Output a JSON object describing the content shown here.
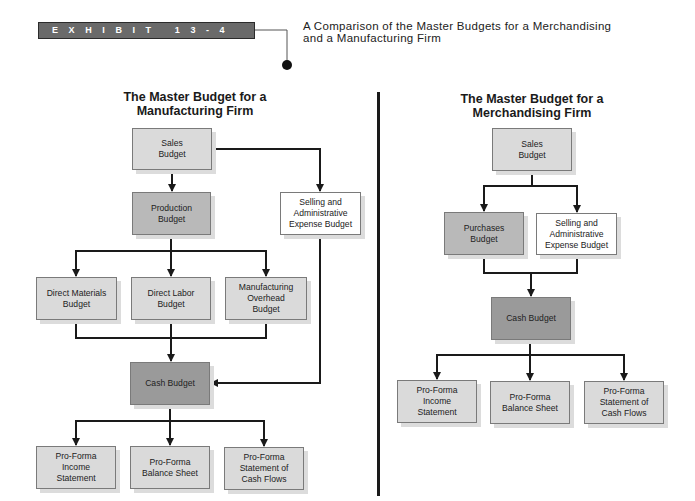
{
  "exhibit": {
    "label": "EXHIBIT 13-4",
    "title_line1": "A Comparison of the Master Budgets for a Merchandising",
    "title_line2": "and a Manufacturing Firm"
  },
  "manufacturing": {
    "title_line1": "The Master Budget for a",
    "title_line2": "Manufacturing Firm",
    "boxes": {
      "sales": [
        "Sales",
        "Budget"
      ],
      "production": [
        "Production",
        "Budget"
      ],
      "selling_admin": [
        "Selling and",
        "Administrative",
        "Expense Budget"
      ],
      "direct_materials": [
        "Direct Materials",
        "Budget"
      ],
      "direct_labor": [
        "Direct Labor",
        "Budget"
      ],
      "mfg_overhead": [
        "Manufacturing",
        "Overhead",
        "Budget"
      ],
      "cash": [
        "Cash Budget"
      ],
      "pf_income": [
        "Pro-Forma",
        "Income",
        "Statement"
      ],
      "pf_balance": [
        "Pro-Forma",
        "Balance Sheet"
      ],
      "pf_cash_flows": [
        "Pro-Forma",
        "Statement of",
        "Cash Flows"
      ]
    }
  },
  "merchandising": {
    "title_line1": "The Master Budget for a",
    "title_line2": "Merchandising Firm",
    "boxes": {
      "sales": [
        "Sales",
        "Budget"
      ],
      "purchases": [
        "Purchases",
        "Budget"
      ],
      "selling_admin": [
        "Selling and",
        "Administrative",
        "Expense Budget"
      ],
      "cash": [
        "Cash Budget"
      ],
      "pf_income": [
        "Pro-Forma",
        "Income",
        "Statement"
      ],
      "pf_balance": [
        "Pro-Forma",
        "Balance Sheet"
      ],
      "pf_cash_flows": [
        "Pro-Forma",
        "Statement of",
        "Cash Flows"
      ]
    }
  },
  "colors": {
    "exhibit_bar": "#6a6a6a",
    "box_light": "#dadada",
    "box_mid": "#b9b9b9",
    "box_dark": "#9a9a9a",
    "line": "#1a1a1a"
  }
}
